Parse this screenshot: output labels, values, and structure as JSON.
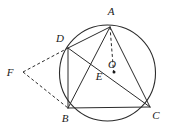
{
  "figure": {
    "background_color": "#ffffff",
    "stroke_color": "#2b2b2b",
    "label_color": "#1a1a1a",
    "width": 169,
    "height": 140
  },
  "circle": {
    "name": "circumscribed-circle",
    "center_x": 107.5,
    "center_y": 73,
    "radius": 48,
    "style": "solid"
  },
  "points": [
    {
      "id": "A",
      "label": "A",
      "x": 110,
      "y": 27,
      "label_x": 111,
      "label_y": 15,
      "marker": false
    },
    {
      "id": "B",
      "label": "B",
      "x": 68,
      "y": 108,
      "label_x": 65,
      "label_y": 122,
      "marker": false
    },
    {
      "id": "C",
      "label": "C",
      "x": 150,
      "y": 107,
      "label_x": 156,
      "label_y": 119,
      "marker": false
    },
    {
      "id": "D",
      "label": "D",
      "x": 68,
      "y": 48,
      "label_x": 60,
      "label_y": 42,
      "marker": false
    },
    {
      "id": "E",
      "label": "E",
      "x": 110,
      "y": 73,
      "label_x": 99,
      "label_y": 80,
      "marker": false
    },
    {
      "id": "O",
      "label": "O",
      "x": 114,
      "y": 72,
      "label_x": 112,
      "label_y": 68,
      "marker": true
    },
    {
      "id": "F",
      "label": "F",
      "x": 23,
      "y": 72,
      "label_x": 10,
      "label_y": 76,
      "marker": false
    }
  ],
  "segments": [
    {
      "name": "segment-AB",
      "from": "A",
      "to": "B",
      "style": "solid"
    },
    {
      "name": "segment-AC",
      "from": "A",
      "to": "C",
      "style": "solid"
    },
    {
      "name": "segment-BC",
      "from": "B",
      "to": "C",
      "style": "solid"
    },
    {
      "name": "segment-AD",
      "from": "A",
      "to": "D",
      "style": "solid"
    },
    {
      "name": "segment-DB",
      "from": "D",
      "to": "B",
      "style": "solid"
    },
    {
      "name": "segment-DC",
      "from": "D",
      "to": "C",
      "style": "solid"
    },
    {
      "name": "segment-AO",
      "from": "A",
      "to": "O",
      "style": "dashed"
    },
    {
      "name": "segment-FD",
      "from": "F",
      "to": "D",
      "style": "dashed"
    },
    {
      "name": "segment-FB",
      "from": "F",
      "to": "B",
      "style": "dashed"
    }
  ],
  "labels": {
    "A": "A",
    "B": "B",
    "C": "C",
    "D": "D",
    "E": "E",
    "O": "O",
    "F": "F"
  }
}
